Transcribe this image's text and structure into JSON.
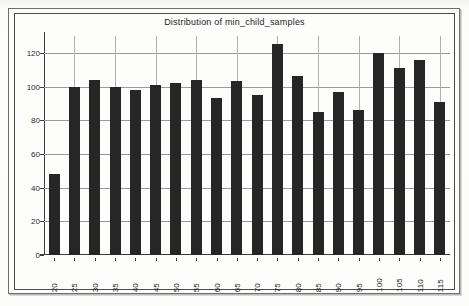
{
  "chart_data": {
    "type": "bar",
    "title": "Distribution of min_child_samples",
    "xlabel": "",
    "ylabel": "",
    "categories": [
      "20",
      "25",
      "30",
      "35",
      "40",
      "45",
      "50",
      "55",
      "60",
      "65",
      "70",
      "75",
      "80",
      "85",
      "90",
      "95",
      "100",
      "105",
      "110",
      "115"
    ],
    "values": [
      48,
      100,
      104,
      100,
      98,
      101,
      102,
      104,
      93,
      103,
      95,
      125,
      106,
      85,
      97,
      86,
      120,
      111,
      116,
      91
    ],
    "ylim": [
      0,
      130
    ],
    "yticks": [
      0,
      20,
      40,
      60,
      80,
      100,
      120
    ],
    "ytick_labels": [
      "0",
      "20",
      "40",
      "60",
      "80",
      "100",
      "120"
    ],
    "grid": true,
    "legend": null,
    "bar_color": "#262626",
    "gridline_color": "#9a9a9a",
    "axis_color": "#3d3d3d",
    "background_color": "#fdfdfc"
  }
}
